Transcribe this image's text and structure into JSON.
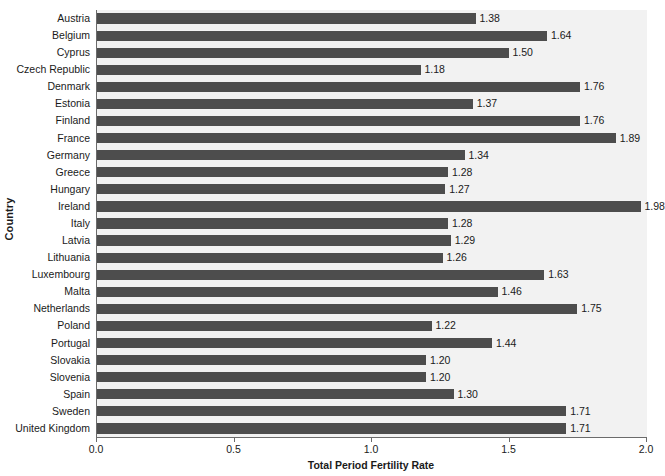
{
  "chart_data": {
    "type": "bar",
    "orientation": "horizontal",
    "title": "",
    "xlabel": "Total Period Fertility Rate",
    "ylabel": "Country",
    "xlim": [
      0.0,
      2.0
    ],
    "xticks": [
      "0.0",
      "0.5",
      "1.0",
      "1.5",
      "2.0"
    ],
    "xtick_values": [
      0.0,
      0.5,
      1.0,
      1.5,
      2.0
    ],
    "grid": false,
    "legend": null,
    "bar_color": "#4d4d4d",
    "plot_background": "#f2f2f2",
    "categories": [
      "Austria",
      "Belgium",
      "Cyprus",
      "Czech Republic",
      "Denmark",
      "Estonia",
      "Finland",
      "France",
      "Germany",
      "Greece",
      "Hungary",
      "Ireland",
      "Italy",
      "Latvia",
      "Lithuania",
      "Luxembourg",
      "Malta",
      "Netherlands",
      "Poland",
      "Portugal",
      "Slovakia",
      "Slovenia",
      "Spain",
      "Sweden",
      "United Kingdom"
    ],
    "values": [
      1.38,
      1.64,
      1.5,
      1.18,
      1.76,
      1.37,
      1.76,
      1.89,
      1.34,
      1.28,
      1.27,
      1.98,
      1.28,
      1.29,
      1.26,
      1.63,
      1.46,
      1.75,
      1.22,
      1.44,
      1.2,
      1.2,
      1.3,
      1.71,
      1.71
    ],
    "value_labels": [
      "1.38",
      "1.64",
      "1.50",
      "1.18",
      "1.76",
      "1.37",
      "1.76",
      "1.89",
      "1.34",
      "1.28",
      "1.27",
      "1.98",
      "1.28",
      "1.29",
      "1.26",
      "1.63",
      "1.46",
      "1.75",
      "1.22",
      "1.44",
      "1.20",
      "1.20",
      "1.30",
      "1.71",
      "1.71"
    ]
  }
}
